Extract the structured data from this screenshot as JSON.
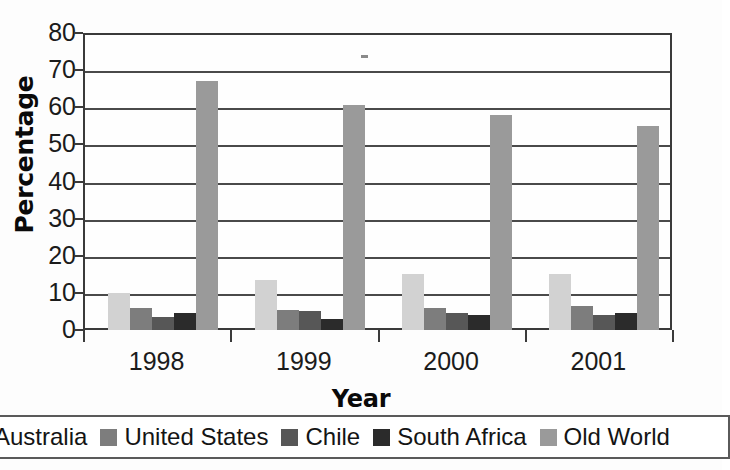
{
  "chart_data": {
    "type": "bar",
    "title": "",
    "xlabel": "Year",
    "ylabel": "Percentage",
    "categories": [
      "1998",
      "1999",
      "2000",
      "2001"
    ],
    "ylim": [
      0,
      80
    ],
    "yticks": [
      0,
      10,
      20,
      30,
      40,
      50,
      60,
      70,
      80
    ],
    "grid": true,
    "legend_position": "bottom",
    "series": [
      {
        "name": "Australia",
        "color": "#d2d2d2",
        "values": [
          10,
          13.5,
          15,
          15
        ]
      },
      {
        "name": "United States",
        "color": "#7d7d7d",
        "values": [
          6,
          5.5,
          6,
          6.5
        ]
      },
      {
        "name": "Chile",
        "color": "#575757",
        "values": [
          3.5,
          5,
          4.5,
          4
        ]
      },
      {
        "name": "South Africa",
        "color": "#2b2b2b",
        "values": [
          4.5,
          3,
          4,
          4.5
        ]
      },
      {
        "name": "Old World",
        "color": "#9a9a9a",
        "values": [
          67,
          60.5,
          58,
          55
        ]
      }
    ]
  },
  "axis": {
    "y_title": "Percentage",
    "x_title": "Year",
    "y_tick_labels": [
      "80",
      "70",
      "60",
      "50",
      "40",
      "30",
      "20",
      "10",
      "0"
    ],
    "x_tick_labels": [
      "1998",
      "1999",
      "2000",
      "2001"
    ]
  },
  "legend": {
    "items": [
      {
        "label": "Australia",
        "color": "#d2d2d2"
      },
      {
        "label": "United States",
        "color": "#7d7d7d"
      },
      {
        "label": "Chile",
        "color": "#575757"
      },
      {
        "label": "South Africa",
        "color": "#2b2b2b"
      },
      {
        "label": "Old World",
        "color": "#9a9a9a"
      }
    ]
  }
}
